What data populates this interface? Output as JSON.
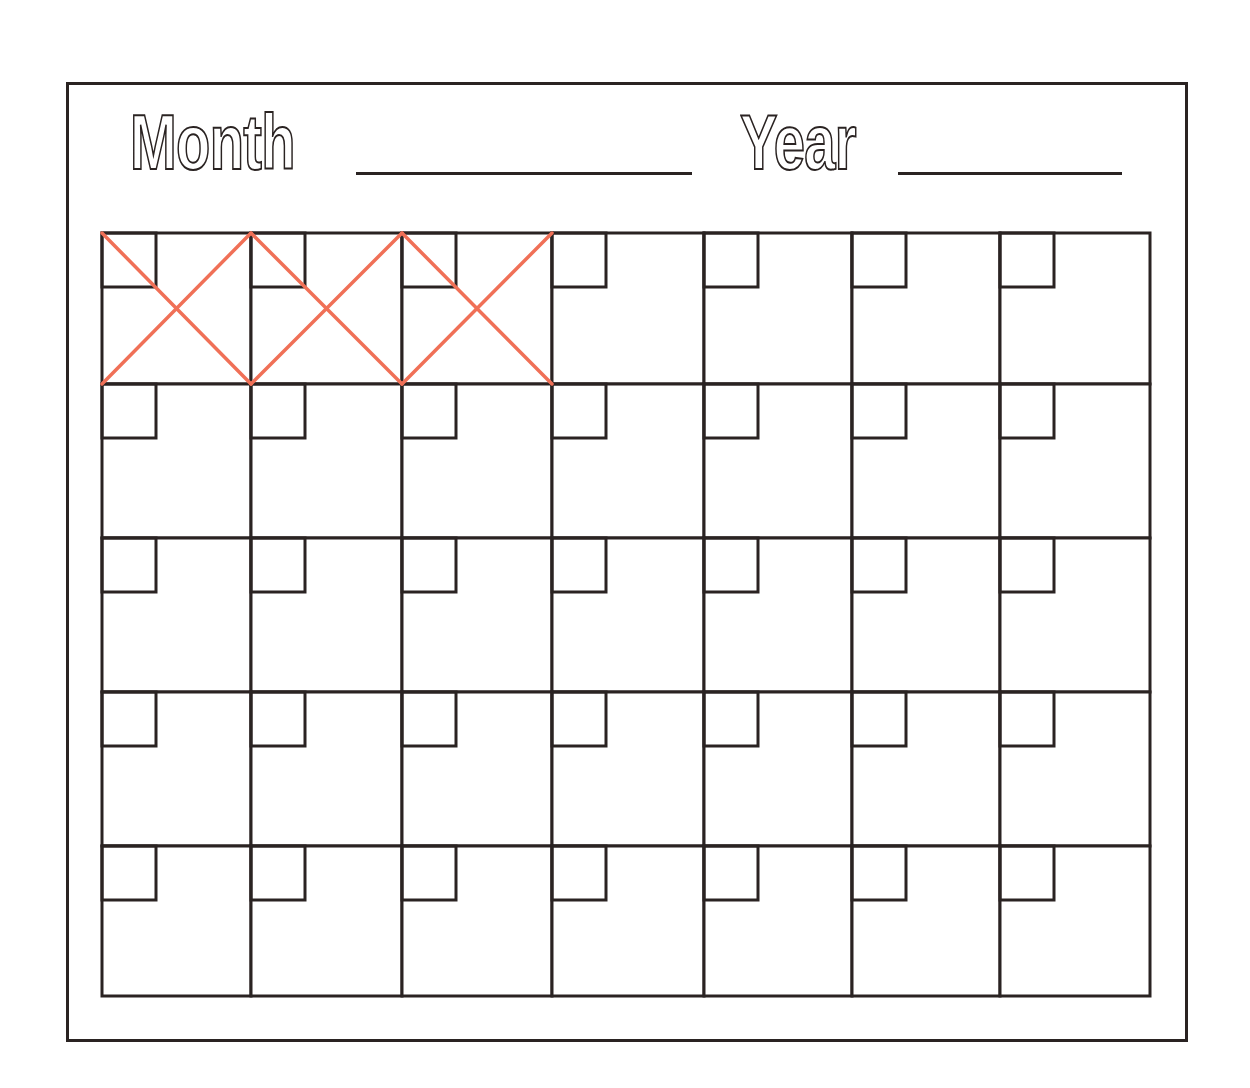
{
  "header": {
    "month_label": "Month",
    "year_label": "Year",
    "month_value": "",
    "year_value": ""
  },
  "calendar": {
    "columns": 7,
    "rows": 5,
    "crossed_out_cells": [
      0,
      1,
      2
    ],
    "cells": [
      {
        "date": ""
      },
      {
        "date": ""
      },
      {
        "date": ""
      },
      {
        "date": ""
      },
      {
        "date": ""
      },
      {
        "date": ""
      },
      {
        "date": ""
      },
      {
        "date": ""
      },
      {
        "date": ""
      },
      {
        "date": ""
      },
      {
        "date": ""
      },
      {
        "date": ""
      },
      {
        "date": ""
      },
      {
        "date": ""
      },
      {
        "date": ""
      },
      {
        "date": ""
      },
      {
        "date": ""
      },
      {
        "date": ""
      },
      {
        "date": ""
      },
      {
        "date": ""
      },
      {
        "date": ""
      },
      {
        "date": ""
      },
      {
        "date": ""
      },
      {
        "date": ""
      },
      {
        "date": ""
      },
      {
        "date": ""
      },
      {
        "date": ""
      },
      {
        "date": ""
      },
      {
        "date": ""
      },
      {
        "date": ""
      },
      {
        "date": ""
      },
      {
        "date": ""
      },
      {
        "date": ""
      },
      {
        "date": ""
      },
      {
        "date": ""
      }
    ]
  },
  "colors": {
    "ink": "#2a2322",
    "cross_mark": "#f07057",
    "paper": "#ffffff"
  }
}
